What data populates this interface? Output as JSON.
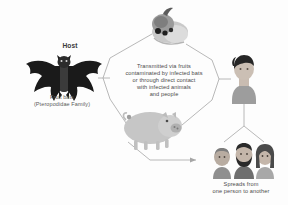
{
  "diagram": {
    "background": "#fdfdfd",
    "line_color": "#9a9a9a",
    "text_color": "#4a4a4a"
  },
  "host": {
    "label": "Host",
    "caption_line1": "Fruit bats",
    "caption_line2": "(Pteropodidae Family)",
    "icon": "bat-icon",
    "color": "#1c1c1c"
  },
  "fruit": {
    "icon": "fruit-icon",
    "color": "#b8b8b8",
    "accent": "#2e2e2e"
  },
  "pig": {
    "icon": "pig-icon",
    "color": "#c4c4c4"
  },
  "person": {
    "icon": "person-icon",
    "hair_color": "#2b2b2b",
    "skin_color": "#cbbfb4",
    "shirt_color": "#9d9d9d"
  },
  "transmission": {
    "line1": "Transmitted via fruits",
    "line2": "contaminated by infected bats",
    "line3": "or through direct contact",
    "line4": "with infected animals",
    "line5": "and people"
  },
  "spread": {
    "line1": "Spreads from",
    "line2": "one person to another",
    "people": [
      {
        "name": "person-bald",
        "hair_color": "#6e6e6e",
        "skin_color": "#b6aa9f"
      },
      {
        "name": "person-bearded",
        "hair_color": "#2a2a2a",
        "skin_color": "#c2b4a8"
      },
      {
        "name": "person-long-hair",
        "hair_color": "#4a4a4a",
        "skin_color": "#c2b4a8"
      }
    ]
  }
}
